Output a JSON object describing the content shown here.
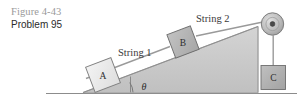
{
  "caption": {
    "figure_number": "Figure 4-43",
    "problem_number": "Problem 95"
  },
  "diagram": {
    "labels": {
      "string1": "String 1",
      "string2": "String 2",
      "block_a": "A",
      "block_b": "B",
      "block_c": "C",
      "angle": "θ"
    },
    "colors": {
      "incline_fill": "#c9c9c9",
      "incline_edge": "#8f8f8f",
      "block_a_fill": "#ececec",
      "block_b_fill": "#b5b5b5",
      "block_c_fill": "#b0b0b0",
      "block_edge": "#6e6e6e",
      "string": "#9a9a9a",
      "pulley_fill": "#bdbdbd",
      "pulley_edge": "#7d7d7d",
      "ground": "#8c8c8c",
      "caption_gray": "#9a9a9a",
      "caption_dark": "#2b2b2b"
    }
  }
}
